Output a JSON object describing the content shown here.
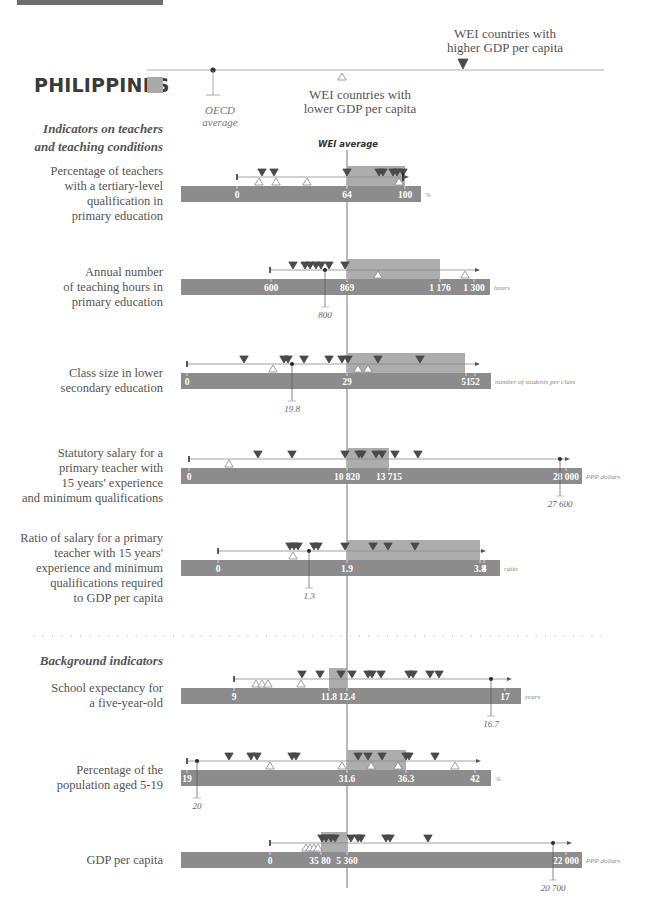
{
  "header": {
    "country": "PHILIPPINES",
    "legend_higher": "WEI countries with higher GDP per capita",
    "legend_higher_lines": [
      "WEI countries with",
      "higher GDP per capita"
    ],
    "legend_lower_lines": [
      "WEI countries with",
      "lower GDP per capita"
    ],
    "legend_oecd_lines": [
      "OECD",
      "average"
    ]
  },
  "sections": {
    "teachers_lines": [
      "Indicators on teachers",
      "and teaching conditions"
    ],
    "background": "Background indicators"
  },
  "wei_average_label": "WEI average",
  "colors": {
    "bar": "#8c8c8c",
    "range_box": "#adadad",
    "marker_dark": "#4a4a4a",
    "line": "#777777",
    "country_swatch": "#a9a9a9"
  },
  "chart_data": {
    "type": "dot-strip",
    "title": "PHILIPPINES",
    "reference_line": "WEI average",
    "indicators": [
      {
        "id": "tertiary",
        "label_lines": [
          "Percentage of teachers",
          "with a tertiary-level",
          "qualification in",
          "primary education"
        ],
        "unit": "%",
        "ticks": [
          {
            "v": "0",
            "x": 237
          },
          {
            "v": "64",
            "x": 347
          },
          {
            "v": "100",
            "x": 405
          }
        ],
        "wei_average": 64,
        "philippines": 100,
        "box": [
          347,
          405
        ],
        "higher_gdp_x": [
          262,
          274,
          347,
          379,
          383,
          393,
          397,
          403
        ],
        "lower_gdp_x": [
          259,
          276,
          307,
          399
        ],
        "line": [
          237,
          405
        ],
        "y": 177
      },
      {
        "id": "hours",
        "label_lines": [
          "Annual number",
          "of teaching hours in",
          "primary education"
        ],
        "unit": "hours",
        "ticks": [
          {
            "v": "600",
            "x": 271
          },
          {
            "v": "869",
            "x": 347
          },
          {
            "v": "1 176",
            "x": 440
          },
          {
            "v": "1 300",
            "x": 474
          }
        ],
        "wei_average": 869,
        "philippines": 800,
        "oecd_value_label": "800",
        "oecd_x": 325,
        "box": [
          347,
          440
        ],
        "higher_gdp_x": [
          293,
          305,
          310,
          316,
          321,
          329,
          345
        ],
        "lower_gdp_x": [
          378,
          465
        ],
        "line": [
          270,
          476
        ],
        "y": 270
      },
      {
        "id": "class_size",
        "label_lines": [
          "Class size in lower",
          "secondary education"
        ],
        "unit": "number of students per class",
        "ticks": [
          {
            "v": "0",
            "x": 187
          },
          {
            "v": "29",
            "x": 347
          },
          {
            "v": "51",
            "x": 466
          },
          {
            "v": "52",
            "x": 475
          }
        ],
        "wei_average": 29,
        "philippines": 19.8,
        "oecd_value_label": "19.8",
        "oecd_x": 292,
        "box": [
          347,
          465
        ],
        "higher_gdp_x": [
          244,
          284,
          288,
          304,
          329,
          342,
          348,
          378,
          420
        ],
        "lower_gdp_x": [
          273,
          358,
          368
        ],
        "line": [
          187,
          476
        ],
        "y": 364
      },
      {
        "id": "salary",
        "label_lines": [
          "Statutory salary for a",
          "primary teacher with",
          "15 years' experience",
          "and minimum qualifications"
        ],
        "unit": "PPP dollars",
        "ticks": [
          {
            "v": "0",
            "x": 189
          },
          {
            "v": "10 820",
            "x": 347
          },
          {
            "v": "13 715",
            "x": 389
          },
          {
            "v": "28 000",
            "x": 566
          }
        ],
        "wei_average": 10820,
        "philippines": 27600,
        "oecd_value_label": "27 600",
        "oecd_x": 560,
        "box": [
          347,
          389
        ],
        "higher_gdp_x": [
          258,
          292,
          345,
          359,
          362,
          376,
          382,
          395,
          418
        ],
        "lower_gdp_x": [
          229
        ],
        "line": [
          189,
          566
        ],
        "y": 459
      },
      {
        "id": "ratio",
        "label_lines": [
          "Ratio of salary for a primary",
          "teacher with 15 years'",
          "experience and minimum",
          "qualifications required",
          "to GDP per capita"
        ],
        "unit": "ratio",
        "ticks": [
          {
            "v": "0",
            "x": 218
          },
          {
            "v": "1.9",
            "x": 347
          },
          {
            "v": "3.8",
            "x": 480
          },
          {
            "v": "4",
            "x": 484
          }
        ],
        "wei_average": 1.9,
        "philippines": 1.3,
        "oecd_value_label": "1.3",
        "oecd_x": 309,
        "box": [
          347,
          480
        ],
        "higher_gdp_x": [
          290,
          294,
          298,
          314,
          318,
          345,
          373,
          388,
          415
        ],
        "lower_gdp_x": [
          293
        ],
        "line": [
          218,
          482
        ],
        "y": 551
      },
      {
        "id": "school_expectancy",
        "label_lines": [
          "School expectancy for",
          "a five-year-old"
        ],
        "unit": "years",
        "ticks": [
          {
            "v": "9",
            "x": 234
          },
          {
            "v": "11.8",
            "x": 329
          },
          {
            "v": "12.4",
            "x": 347
          },
          {
            "v": "17",
            "x": 505
          }
        ],
        "wei_average": 12.4,
        "philippines": 16.7,
        "oecd_value_label": "16.7",
        "oecd_x": 491,
        "box": [
          329,
          347
        ],
        "higher_gdp_x": [
          302,
          320,
          341,
          352,
          368,
          372,
          381,
          409,
          413,
          430,
          439
        ],
        "lower_gdp_x": [
          256,
          262,
          268,
          301
        ],
        "line": [
          234,
          508
        ],
        "y": 679
      },
      {
        "id": "population",
        "label_lines": [
          "Percentage of the",
          "population aged 5-19"
        ],
        "unit": "%",
        "ticks": [
          {
            "v": "19",
            "x": 187
          },
          {
            "v": "31.6",
            "x": 347
          },
          {
            "v": "36.3",
            "x": 406
          },
          {
            "v": "42",
            "x": 475
          }
        ],
        "wei_average": 31.6,
        "philippines": 20,
        "oecd_value_label": "20",
        "oecd_x": 197,
        "box": [
          347,
          406
        ],
        "higher_gdp_x": [
          229,
          251,
          257,
          292,
          296,
          358,
          368,
          382,
          406,
          409,
          435
        ],
        "lower_gdp_x": [
          270,
          342,
          371,
          398,
          455
        ],
        "line": [
          187,
          477
        ],
        "y": 761
      },
      {
        "id": "gdp",
        "label_lines": [
          "GDP per capita"
        ],
        "unit": "PPP dollars",
        "ticks": [
          {
            "v": "0",
            "x": 270
          },
          {
            "v": "3580",
            "x": 321
          },
          {
            "v": "5 360",
            "x": 347
          },
          {
            "v": "22 000",
            "x": 566
          }
        ],
        "tick_text_override": [
          {
            "v": "0",
            "x": 270
          },
          {
            "v": "35 80",
            "x": 320
          },
          {
            "v": "5 360",
            "x": 347
          },
          {
            "v": "22 000",
            "x": 566
          }
        ],
        "wei_average": 5360,
        "philippines": 20700,
        "oecd_value_label": "20 700",
        "oecd_x": 553,
        "box": [
          321,
          347
        ],
        "higher_gdp_x": [
          322,
          326,
          331,
          335,
          351,
          358,
          361,
          386,
          390,
          428
        ],
        "lower_gdp_x": [
          306,
          310,
          314,
          318
        ],
        "line": [
          270,
          568
        ],
        "y": 843
      }
    ]
  }
}
